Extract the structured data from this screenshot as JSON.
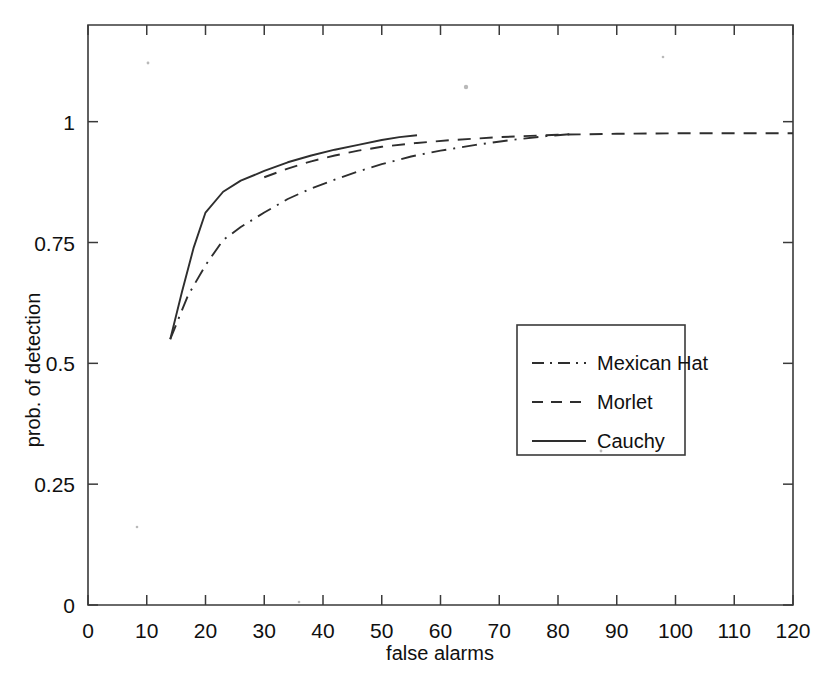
{
  "chart_data": {
    "type": "line",
    "title": "",
    "xlabel": "false alarms",
    "ylabel": "prob. of detection",
    "xlim": [
      0,
      120
    ],
    "ylim": [
      0,
      1.2
    ],
    "xticks": [
      0,
      10,
      20,
      30,
      40,
      50,
      60,
      70,
      80,
      90,
      100,
      110,
      120
    ],
    "xticklabels": [
      "0",
      "10",
      "20",
      "30",
      "40",
      "50",
      "60",
      "70",
      "80",
      "90",
      "100",
      "110",
      "120"
    ],
    "yticks": [
      0,
      0.25,
      0.5,
      0.75,
      1
    ],
    "yticklabels": [
      "0",
      "0.25",
      "0.5",
      "0.75",
      "1"
    ],
    "grid": false,
    "legend_position": "center-right",
    "series": [
      {
        "name": "Mexican Hat",
        "style": "dash-dot",
        "color": "#2e2e2e",
        "points": [
          [
            14.0,
            0.55
          ],
          [
            17.0,
            0.64
          ],
          [
            20.0,
            0.703
          ],
          [
            23.0,
            0.755
          ],
          [
            26.0,
            0.782
          ],
          [
            30.0,
            0.812
          ],
          [
            34.0,
            0.84
          ],
          [
            38.0,
            0.862
          ],
          [
            42.0,
            0.88
          ],
          [
            46.0,
            0.897
          ],
          [
            50.0,
            0.912
          ],
          [
            55.0,
            0.928
          ],
          [
            60.0,
            0.94
          ],
          [
            66.0,
            0.952
          ],
          [
            72.0,
            0.962
          ],
          [
            78.0,
            0.97
          ],
          [
            82.0,
            0.974
          ]
        ]
      },
      {
        "name": "Morlet",
        "style": "dashed",
        "color": "#2e2e2e",
        "points": [
          [
            30.0,
            0.885
          ],
          [
            34.0,
            0.903
          ],
          [
            38.0,
            0.918
          ],
          [
            42.0,
            0.93
          ],
          [
            46.0,
            0.94
          ],
          [
            50.0,
            0.948
          ],
          [
            56.0,
            0.956
          ],
          [
            62.0,
            0.962
          ],
          [
            70.0,
            0.968
          ],
          [
            80.0,
            0.973
          ],
          [
            90.0,
            0.975
          ],
          [
            100.0,
            0.976
          ],
          [
            110.0,
            0.976
          ],
          [
            120.0,
            0.976
          ]
        ]
      },
      {
        "name": "Cauchy",
        "style": "solid",
        "color": "#2e2e2e",
        "points": [
          [
            14.0,
            0.55
          ],
          [
            16.0,
            0.648
          ],
          [
            18.0,
            0.74
          ],
          [
            20.0,
            0.812
          ],
          [
            23.0,
            0.855
          ],
          [
            26.0,
            0.878
          ],
          [
            30.0,
            0.898
          ],
          [
            34.0,
            0.916
          ],
          [
            38.0,
            0.93
          ],
          [
            42.0,
            0.942
          ],
          [
            46.0,
            0.952
          ],
          [
            50.0,
            0.962
          ],
          [
            53.0,
            0.968
          ],
          [
            56.0,
            0.972
          ]
        ]
      }
    ]
  },
  "legend": {
    "entries": [
      {
        "label": "Mexican Hat",
        "style": "dash-dot"
      },
      {
        "label": "Morlet",
        "style": "dashed"
      },
      {
        "label": "Cauchy",
        "style": "solid"
      }
    ]
  }
}
